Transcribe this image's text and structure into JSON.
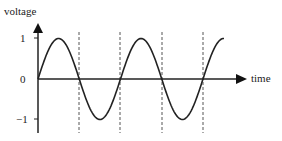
{
  "diagram": {
    "y_axis_label": "voltage",
    "x_axis_label": "time",
    "y_ticks": [
      "1",
      "0",
      "−1"
    ],
    "curve": "sine wave, amplitude 1, ~2.25 periods starting at origin",
    "dashed_lines": "vertical dashed lines at each zero crossing after origin",
    "colors": {
      "stroke": "#222222",
      "background": "#ffffff"
    }
  }
}
